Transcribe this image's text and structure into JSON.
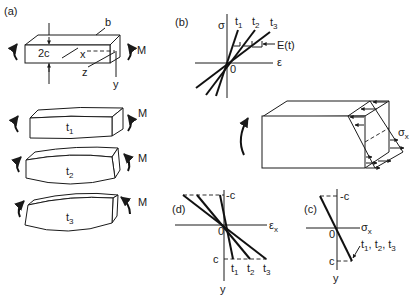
{
  "panels": {
    "a": {
      "label": "(a)",
      "beam_labels": {
        "height": "2c",
        "width": "b",
        "x_axis": "x",
        "y_axis": "y",
        "z_axis": "z",
        "moment": "M"
      },
      "bent_beams": [
        {
          "time": "t",
          "sub": "1",
          "moment": "M"
        },
        {
          "time": "t",
          "sub": "2",
          "moment": "M"
        },
        {
          "time": "t",
          "sub": "3",
          "moment": "M"
        }
      ]
    },
    "b": {
      "label": "(b)",
      "y_axis": "σ",
      "x_axis": "ε",
      "origin": "0",
      "curves": [
        {
          "name": "t",
          "sub": "1"
        },
        {
          "name": "t",
          "sub": "2"
        },
        {
          "name": "t",
          "sub": "3"
        }
      ],
      "modulus_label": "E(t)"
    },
    "stress_block": {
      "label": "σ",
      "sub": "x"
    },
    "d": {
      "label": "(d)",
      "x_axis": "ε",
      "x_sub": "x",
      "y_axis": "y",
      "origin": "0",
      "top_bound": "-c",
      "bottom_bound": "c",
      "curves": [
        {
          "name": "t",
          "sub": "1"
        },
        {
          "name": "t",
          "sub": "2"
        },
        {
          "name": "t",
          "sub": "3"
        }
      ]
    },
    "c": {
      "label": "(c)",
      "x_axis": "σ",
      "x_sub": "x",
      "y_axis": "y",
      "origin": "0",
      "top_bound": "-c",
      "bottom_bound": "c",
      "curve_label": "t1, t2, t3",
      "curve_label_parts": [
        {
          "t": "t",
          "s": "1"
        },
        {
          "t": "t",
          "s": "2"
        },
        {
          "t": "t",
          "s": "3"
        }
      ]
    }
  }
}
